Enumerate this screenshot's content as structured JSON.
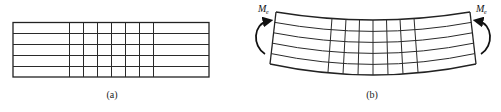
{
  "figure": {
    "panel_a": {
      "caption": "(a)",
      "description": "Undeformed beam with rectangular grid",
      "rows": 5,
      "inner_columns": 6
    },
    "panel_b": {
      "caption": "(b)",
      "description": "Beam under pure bending, grid deformed",
      "rows": 5,
      "inner_columns": 6,
      "moment_left": {
        "symbol": "M",
        "subscript": "e"
      },
      "moment_right": {
        "symbol": "M",
        "subscript": "e"
      }
    },
    "colors": {
      "line": "#2a2a2a",
      "background": "#ffffff"
    }
  }
}
